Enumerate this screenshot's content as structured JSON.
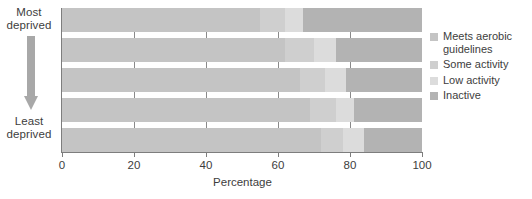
{
  "chart_data": {
    "type": "bar",
    "orientation": "horizontal",
    "stacked": true,
    "title": "",
    "xlabel": "Percentage",
    "ylabel": "",
    "xlim": [
      0,
      100
    ],
    "xticks": [
      0,
      20,
      40,
      60,
      80,
      100
    ],
    "xtick_labels": [
      "0",
      "20",
      "40",
      "60",
      "80",
      "100"
    ],
    "grid": false,
    "legend_position": "right",
    "categories": [
      "Most deprived",
      "Quintile 2",
      "Quintile 3",
      "Quintile 4",
      "Least deprived"
    ],
    "series": [
      {
        "name": "Meets aerobic guidelines",
        "color": "#c4c4c4",
        "values": [
          55,
          62,
          66,
          69,
          72
        ]
      },
      {
        "name": "Some activity",
        "color": "#cfcfcf",
        "values": [
          7,
          8,
          7,
          7,
          6
        ]
      },
      {
        "name": "Low activity",
        "color": "#dcdcdc",
        "values": [
          5,
          6,
          6,
          5,
          6
        ]
      },
      {
        "name": "Inactive",
        "color": "#b3b3b3",
        "values": [
          33,
          24,
          21,
          19,
          16
        ]
      }
    ],
    "axis_annotation": {
      "top_label": "Most\ndeprived",
      "bottom_label": "Least\ndeprived",
      "arrow_direction": "down"
    }
  },
  "axis": {
    "y_top_line1": "Most",
    "y_top_line2": "deprived",
    "y_bottom_line1": "Least",
    "y_bottom_line2": "deprived",
    "x_title": "Percentage",
    "ticks": [
      "0",
      "20",
      "40",
      "60",
      "80",
      "100"
    ]
  },
  "legend": {
    "items": [
      {
        "label_line1": "Meets aerobic",
        "label_line2": "guidelines",
        "color": "#c4c4c4"
      },
      {
        "label_line1": "Some activity",
        "label_line2": "",
        "color": "#cfcfcf"
      },
      {
        "label_line1": "Low activity",
        "label_line2": "",
        "color": "#dcdcdc"
      },
      {
        "label_line1": "Inactive",
        "label_line2": "",
        "color": "#b3b3b3"
      }
    ]
  }
}
